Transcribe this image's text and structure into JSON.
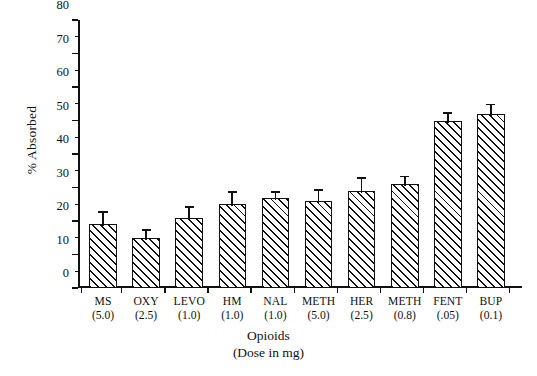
{
  "chart_data": {
    "type": "bar",
    "title": "",
    "xlabel": "Opioids",
    "xlabel_sub": "(Dose in mg)",
    "ylabel": "% Absorbed",
    "ylim": [
      0,
      80
    ],
    "ytick_step": 10,
    "yminor_step": 5,
    "grid": false,
    "legend": "none",
    "categories": [
      "MS",
      "OXY",
      "LEVO",
      "HM",
      "NAL",
      "METH",
      "HER",
      "METH",
      "FENT",
      "BUP"
    ],
    "doses": [
      "(5.0)",
      "(2.5)",
      "(1.0)",
      "(1.0)",
      "(1.0)",
      "(5.0)",
      "(2.5)",
      "(0.8)",
      "(.05)",
      "(0.1)"
    ],
    "values": [
      19,
      15,
      21,
      25,
      27,
      26,
      29,
      31,
      50,
      52
    ],
    "errors": [
      3.5,
      2,
      3,
      3.5,
      1.5,
      3,
      3.5,
      2,
      2,
      2.5
    ],
    "yticks": [
      0,
      10,
      20,
      30,
      40,
      50,
      60,
      70,
      80
    ],
    "ytick_labels": [
      "0",
      "10",
      "20",
      "30",
      "40",
      "50",
      "60",
      "70",
      "80"
    ],
    "series_name": "% Absorbed",
    "bar_fill": "hatch-45",
    "bar_color": "#111111"
  }
}
